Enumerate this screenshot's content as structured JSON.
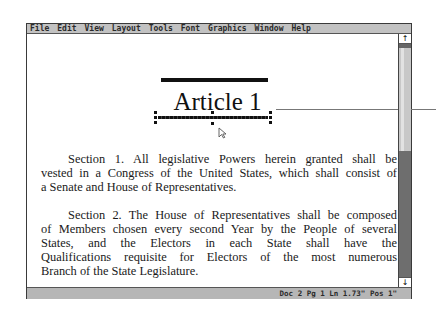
{
  "menubar": {
    "items": [
      "File",
      "Edit",
      "View",
      "Layout",
      "Tools",
      "Font",
      "Graphics",
      "Window",
      "Help"
    ]
  },
  "document": {
    "title": "Article 1",
    "paragraphs": [
      {
        "lines": [
          "Section 1. All legislative Powers herein granted shall be",
          "vested in a Congress of the United States, which shall consist of",
          "a Senate and House of Representatives."
        ]
      },
      {
        "lines": [
          "Section 2. The House of Representatives shall be composed",
          "of Members chosen every second Year by the People of several",
          "States, and the Electors in each State shall have the",
          "Qualifications requisite for Electors of the most numerous",
          "Branch of the State Legislature."
        ]
      }
    ]
  },
  "scrollbar": {
    "up_icon": "↑",
    "down_icon": "↓"
  },
  "statusbar": {
    "text": "Doc 2 Pg 1 Ln 1.73\" Pos 1\""
  }
}
